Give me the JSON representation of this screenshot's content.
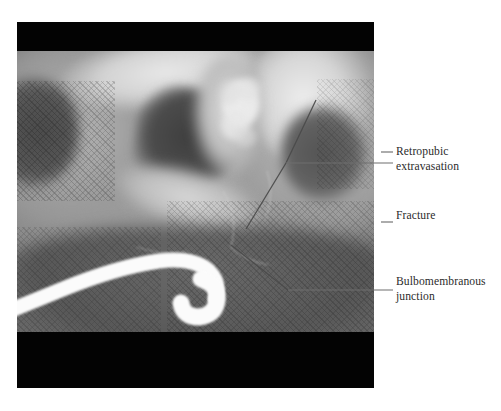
{
  "figure": {
    "modality": "retrograde urethrogram radiograph",
    "background_color": "#ffffff",
    "plate": {
      "letterbox_color": "#030303",
      "field_tone": "#8f8f8f"
    },
    "structures": {
      "urethra_label": "contrast-filled bulbous urethra",
      "catheter_label": "catheter",
      "obturator_foramen_label": "obturator foramen",
      "pubic_ramus_label": "pubic ramus",
      "grid_artifact_label": "anti-scatter grid crosshatch"
    }
  },
  "annotations": [
    {
      "id": "retropubic",
      "line1": "Retropubic",
      "line2": "extravasation",
      "leader_color": "#6e6e6e"
    },
    {
      "id": "fracture",
      "line1": "Fracture",
      "line2": "",
      "leader_color": "#6e6e6e"
    },
    {
      "id": "bulbomembranous",
      "line1": "Bulbomembranous",
      "line2": "junction",
      "leader_color": "#6e6e6e"
    }
  ],
  "colors": {
    "text": "#2b2b2b",
    "leader": "#6e6e6e",
    "plate_black": "#030303",
    "contrast_bright": "#fbfbfb"
  }
}
